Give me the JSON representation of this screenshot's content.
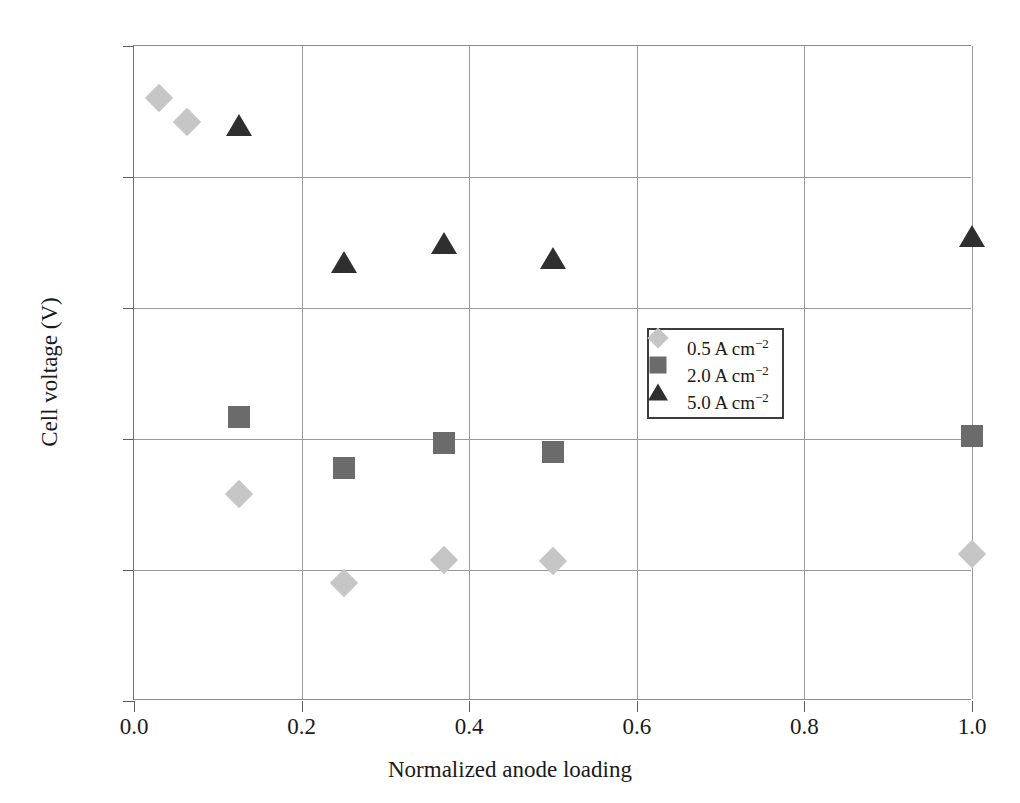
{
  "chart_data": {
    "type": "scatter",
    "title": "",
    "xlabel": "Normalized anode loading",
    "ylabel": "Cell voltage (V)",
    "xlim": [
      0.0,
      1.0
    ],
    "ylim": [
      1.5,
      2.0
    ],
    "xticks": [
      "0.0",
      "0.2",
      "0.4",
      "0.6",
      "0.8",
      "1.0"
    ],
    "xtick_values": [
      0.0,
      0.2,
      0.4,
      0.6,
      0.8,
      1.0
    ],
    "yticks": [
      "1.50",
      "1.60",
      "1.70",
      "1.80",
      "1.90",
      "2.00"
    ],
    "ytick_values": [
      1.5,
      1.6,
      1.7,
      1.8,
      1.9,
      2.0
    ],
    "grid": true,
    "grid_axes": "both",
    "legend_position": "center-right",
    "series": [
      {
        "name": "0.5 A cm",
        "exponent": "−2",
        "marker": "diamond",
        "color": "#c6c6c6",
        "x": [
          0.03,
          0.063,
          0.125,
          0.25,
          0.37,
          0.5,
          1.0
        ],
        "y": [
          1.96,
          1.942,
          1.658,
          1.59,
          1.608,
          1.607,
          1.612
        ]
      },
      {
        "name": "2.0 A cm",
        "exponent": "−2",
        "marker": "square",
        "color": "#6b6b6b",
        "x": [
          0.125,
          0.25,
          0.37,
          0.5,
          1.0
        ],
        "y": [
          1.717,
          1.678,
          1.697,
          1.69,
          1.702
        ]
      },
      {
        "name": "5.0 A cm",
        "exponent": "−2",
        "marker": "triangle",
        "color": "#2f2f2f",
        "x": [
          0.125,
          0.25,
          0.37,
          0.5,
          1.0
        ],
        "y": [
          1.94,
          1.835,
          1.85,
          1.838,
          1.855
        ]
      }
    ]
  },
  "legend": {
    "entries": [
      {
        "label": "0.5 A cm",
        "exponent": "−2",
        "marker": "diamond",
        "color": "#c6c6c6"
      },
      {
        "label": "2.0 A cm",
        "exponent": "−2",
        "marker": "square",
        "color": "#6b6b6b"
      },
      {
        "label": "5.0 A cm",
        "exponent": "−2",
        "marker": "triangle",
        "color": "#2f2f2f"
      }
    ]
  },
  "axes": {
    "x_title": "Normalized anode loading",
    "y_title": "Cell voltage (V)"
  },
  "colors": {
    "grid": "#9a9a9a",
    "axis": "#6f6f6f",
    "text": "#1a1a1a",
    "background": "#ffffff",
    "legend_border": "#3c3c3c"
  }
}
